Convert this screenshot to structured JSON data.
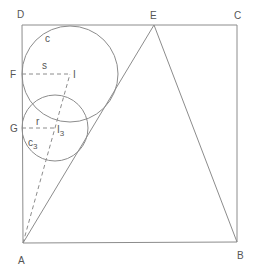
{
  "diagram": {
    "colors": {
      "line": "#8c8c8c",
      "text": "#555555",
      "background": "#ffffff"
    },
    "points": {
      "A": {
        "label": "A",
        "x": 23,
        "y": 243
      },
      "B": {
        "label": "B",
        "x": 237,
        "y": 242
      },
      "C": {
        "label": "C",
        "x": 237,
        "y": 25
      },
      "D": {
        "label": "D",
        "x": 22,
        "y": 25
      },
      "E": {
        "label": "E",
        "x": 154,
        "y": 25
      },
      "F": {
        "label": "F",
        "x": 22,
        "y": 74
      },
      "G": {
        "label": "G",
        "x": 22,
        "y": 128
      },
      "I": {
        "label": "I",
        "x": 70,
        "y": 74
      },
      "I3": {
        "label": "I",
        "sub": "3",
        "x": 55,
        "y": 128
      }
    },
    "circles": {
      "c": {
        "label": "c",
        "cx": 70,
        "cy": 74,
        "r": 48
      },
      "c3": {
        "label": "c",
        "sub": "3",
        "cx": 55,
        "cy": 128,
        "r": 33
      }
    },
    "segment_labels": {
      "s": "s",
      "r": "r"
    }
  }
}
